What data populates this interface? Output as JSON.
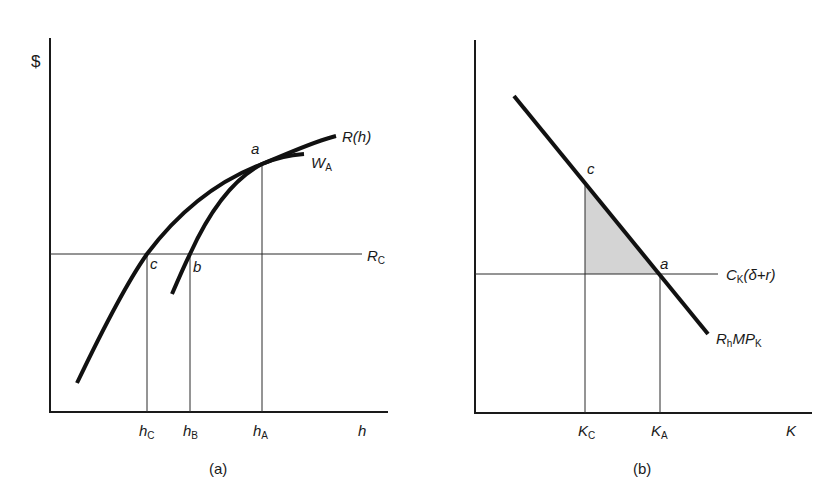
{
  "colors": {
    "background": "#ffffff",
    "ink": "#111111",
    "shading": "#d4d4d4"
  },
  "panel_a": {
    "caption": "(a)",
    "y_axis_label": "$",
    "x_axis_label": "h",
    "curves": {
      "R_h": "R(h)",
      "W_A_main": "W",
      "W_A_sub": "A"
    },
    "horizontal_line": {
      "main": "R",
      "sub": "C"
    },
    "points": {
      "a": "a",
      "b": "b",
      "c": "c"
    },
    "x_ticks": [
      {
        "main": "h",
        "sub": "C"
      },
      {
        "main": "h",
        "sub": "B"
      },
      {
        "main": "h",
        "sub": "A"
      }
    ]
  },
  "panel_b": {
    "caption": "(b)",
    "x_axis_label": "K",
    "curves": {
      "mp_main1": "R",
      "mp_sub1": "h",
      "mp_main2": "MP",
      "mp_sub2": "K"
    },
    "horizontal_line": {
      "main": "C",
      "sub": "K",
      "rest": "(δ+r)"
    },
    "points": {
      "a": "a",
      "c": "c"
    },
    "x_ticks": [
      {
        "main": "K",
        "sub": "C"
      },
      {
        "main": "K",
        "sub": "A"
      }
    ],
    "shaded_region": "triangle between c, K_C at C_K(δ+r), and a"
  }
}
